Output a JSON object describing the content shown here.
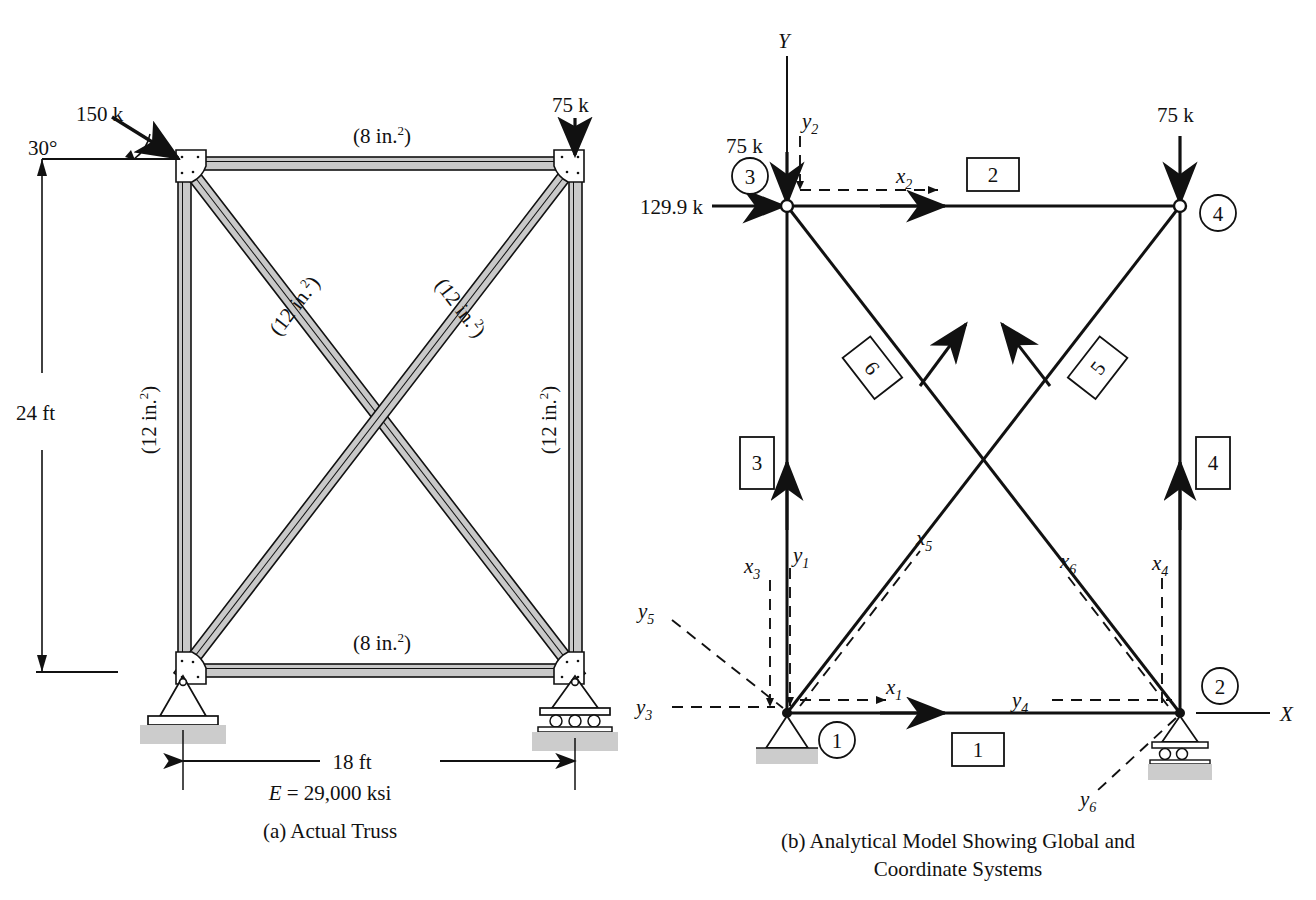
{
  "figure": {
    "panel_a": {
      "id": "a",
      "caption": "(a) Actual Truss",
      "material_note": "E = 29,000 ksi",
      "material_symbol": "E",
      "material_value": "= 29,000 ksi",
      "loads": [
        {
          "name": "inclined-load",
          "label": "150 k",
          "angle_label": "30°",
          "applied_at": "top-left-joint",
          "direction": "inclined-down-right"
        },
        {
          "name": "vertical-load",
          "label": "75 k",
          "applied_at": "top-right-joint",
          "direction": "down"
        }
      ],
      "member_areas": {
        "top_chord": "(8 in.²)",
        "bottom_chord": "(8 in.²)",
        "left_vertical": "(12 in.²)",
        "right_vertical": "(12 in.²)",
        "diagonal_down_right": "(12 in.²)",
        "diagonal_down_left": "(12 in.²)"
      },
      "area_text_8": "(8 in.",
      "area_text_12": "(12 in.",
      "area_exp": "2",
      "area_close": ")",
      "dimensions": {
        "height": "24 ft",
        "span": "18 ft"
      },
      "supports": {
        "left": "pin",
        "right": "roller"
      }
    },
    "panel_b": {
      "id": "b",
      "caption_line1": "(b) Analytical Model Showing Global and",
      "caption_line2": "Coordinate Systems",
      "global_axes": {
        "x": "X",
        "y": "Y"
      },
      "loads": [
        {
          "name": "horizontal-load-node3",
          "label": "129.9 k",
          "direction": "right",
          "at_node": 3
        },
        {
          "name": "vertical-load-node3",
          "label": "75 k",
          "direction": "down",
          "at_node": 3
        },
        {
          "name": "vertical-load-node4",
          "label": "75 k",
          "direction": "down",
          "at_node": 4
        }
      ],
      "nodes": [
        {
          "id": "1",
          "x": 787,
          "y": 713,
          "support": "pin"
        },
        {
          "id": "2",
          "x": 1180,
          "y": 713,
          "support": "roller"
        },
        {
          "id": "3",
          "x": 787,
          "y": 206,
          "support": "none"
        },
        {
          "id": "4",
          "x": 1180,
          "y": 206,
          "support": "none"
        }
      ],
      "members": [
        {
          "id": "1",
          "from": 1,
          "to": 2,
          "orientation": "horizontal-bottom"
        },
        {
          "id": "2",
          "from": 3,
          "to": 4,
          "orientation": "horizontal-top"
        },
        {
          "id": "3",
          "from": 1,
          "to": 3,
          "orientation": "vertical-left"
        },
        {
          "id": "4",
          "from": 2,
          "to": 4,
          "orientation": "vertical-right"
        },
        {
          "id": "5",
          "from": 1,
          "to": 4,
          "orientation": "diagonal-up-right"
        },
        {
          "id": "6",
          "from": 2,
          "to": 3,
          "orientation": "diagonal-up-left"
        }
      ],
      "local_axes": [
        {
          "name": "x1",
          "base": "x",
          "sub": "1"
        },
        {
          "name": "y1",
          "base": "y",
          "sub": "1"
        },
        {
          "name": "x2",
          "base": "x",
          "sub": "2"
        },
        {
          "name": "y2",
          "base": "y",
          "sub": "2"
        },
        {
          "name": "x3",
          "base": "x",
          "sub": "3"
        },
        {
          "name": "y3",
          "base": "y",
          "sub": "3"
        },
        {
          "name": "x4",
          "base": "x",
          "sub": "4"
        },
        {
          "name": "y4",
          "base": "y",
          "sub": "4"
        },
        {
          "name": "x5",
          "base": "x",
          "sub": "5"
        },
        {
          "name": "y5",
          "base": "y",
          "sub": "5"
        },
        {
          "name": "x6",
          "base": "x",
          "sub": "6"
        },
        {
          "name": "y6",
          "base": "y",
          "sub": "6"
        }
      ]
    },
    "colors": {
      "line": "#111111",
      "member_fill": "#c9c9c9",
      "ground_fill": "#cccccc",
      "background": "#ffffff"
    }
  },
  "chart_data": {
    "type": "diagram",
    "geometry": {
      "span_ft": 18,
      "height_ft": 24,
      "modulus_ksi": 29000
    },
    "applied_loads": [
      {
        "node": 3,
        "magnitude_k": 150,
        "angle_deg": 30,
        "note": "actual inclined load"
      },
      {
        "node": 3,
        "magnitude_k": 129.9,
        "direction": "X",
        "note": "resolved horizontal component"
      },
      {
        "node": 3,
        "magnitude_k": 75,
        "direction": "-Y",
        "note": "resolved vertical component"
      },
      {
        "node": 4,
        "magnitude_k": 75,
        "direction": "-Y"
      }
    ],
    "member_areas_in2": {
      "1": 8,
      "2": 8,
      "3": 12,
      "4": 12,
      "5": 12,
      "6": 12
    }
  }
}
